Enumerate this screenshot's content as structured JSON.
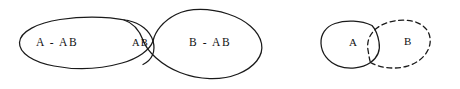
{
  "figure": {
    "background_color": "#ffffff",
    "ink_color": "#1a1a1a",
    "width": 460,
    "height": 89,
    "diagrams": [
      {
        "name": "overlapping-sets-labeled",
        "regions": [
          {
            "id": "a-minus-ab",
            "label": "A - AB",
            "style": "solid"
          },
          {
            "id": "ab-intersection",
            "label": "AB",
            "style": "solid"
          },
          {
            "id": "b-minus-ab",
            "label": "B - AB",
            "style": "solid"
          }
        ]
      },
      {
        "name": "overlapping-sets-ab",
        "regions": [
          {
            "id": "set-a",
            "label": "A",
            "style": "solid"
          },
          {
            "id": "set-b",
            "label": "B",
            "style": "dashed"
          }
        ]
      }
    ]
  },
  "labels": {
    "a_minus_ab": "A - AB",
    "ab": "AB",
    "b_minus_ab": "B - AB",
    "a": "A",
    "b": "B"
  }
}
